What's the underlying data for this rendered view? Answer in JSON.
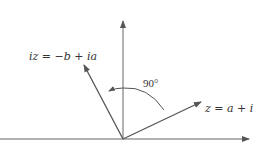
{
  "diagram": {
    "labels": {
      "iz": "iz = −b + ia",
      "z": "z = a + ib",
      "angle": "90°"
    },
    "colors": {
      "axis": "#555555",
      "vector": "#555555",
      "text": "#333333"
    }
  }
}
